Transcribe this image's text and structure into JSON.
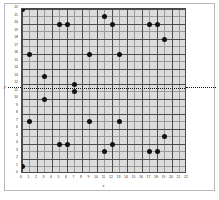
{
  "chart_data": {
    "type": "scatter",
    "title": "",
    "xlabel": "x",
    "ylabel": "y",
    "xlim": [
      0,
      22
    ],
    "ylim": [
      0,
      22
    ],
    "grid": true,
    "legend": null,
    "xticks": [
      0,
      1,
      2,
      3,
      4,
      5,
      6,
      7,
      8,
      9,
      10,
      11,
      12,
      13,
      14,
      15,
      16,
      17,
      18,
      19,
      20,
      21,
      22
    ],
    "yticks": [
      0,
      1,
      2,
      3,
      4,
      5,
      6,
      7,
      8,
      9,
      10,
      11,
      12,
      13,
      14,
      15,
      16,
      17,
      18,
      19,
      20,
      21,
      22
    ],
    "points": [
      {
        "x": 0,
        "y": 22
      },
      {
        "x": 0,
        "y": 1
      },
      {
        "x": 1,
        "y": 16
      },
      {
        "x": 1,
        "y": 7
      },
      {
        "x": 3,
        "y": 13
      },
      {
        "x": 3,
        "y": 10
      },
      {
        "x": 4,
        "y": 0
      },
      {
        "x": 5,
        "y": 20
      },
      {
        "x": 5,
        "y": 4
      },
      {
        "x": 6,
        "y": 20
      },
      {
        "x": 6,
        "y": 4
      },
      {
        "x": 7,
        "y": 12
      },
      {
        "x": 7,
        "y": 11
      },
      {
        "x": 9,
        "y": 16
      },
      {
        "x": 9,
        "y": 7
      },
      {
        "x": 11,
        "y": 21
      },
      {
        "x": 11,
        "y": 3
      },
      {
        "x": 12,
        "y": 20
      },
      {
        "x": 12,
        "y": 4
      },
      {
        "x": 13,
        "y": 16
      },
      {
        "x": 13,
        "y": 7
      },
      {
        "x": 17,
        "y": 20
      },
      {
        "x": 17,
        "y": 3
      },
      {
        "x": 18,
        "y": 20
      },
      {
        "x": 18,
        "y": 3
      },
      {
        "x": 19,
        "y": 18
      },
      {
        "x": 19,
        "y": 5
      }
    ],
    "annotations": [
      {
        "kind": "horizontal-reference-line",
        "y": 11.5,
        "style": "dotted",
        "color": "#111111",
        "label": "y",
        "extends_beyond_axes": true
      }
    ],
    "colors": {
      "point": "#111111",
      "plot_background": "#dcdcdc",
      "grid_major": "#4d4d4d",
      "grid_minor": "#9a9a9a",
      "axis": "#4a4a4a",
      "frame": "#b8b8b8",
      "page_background": "#ffffff"
    }
  }
}
